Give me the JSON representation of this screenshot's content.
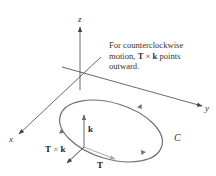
{
  "axes": {
    "x_label": "x",
    "y_label": "y",
    "z_label": "z"
  },
  "curve": {
    "label": "C",
    "color": "#707070"
  },
  "vectors": {
    "k": {
      "label": "k"
    },
    "T": {
      "label": "T"
    },
    "TxK": {
      "label_T": "T",
      "label_times": " × ",
      "label_k": "k"
    }
  },
  "caption": {
    "line1": "For counterclockwise",
    "line2_pre": "motion, ",
    "line2_T": "T",
    "line2_times": " × ",
    "line2_k": "k",
    "line2_post": " points",
    "line3": "outward."
  },
  "colors": {
    "axis": "#444444",
    "curve": "#707070",
    "vector": "#666666",
    "T_vector": "#9a9a9a"
  }
}
